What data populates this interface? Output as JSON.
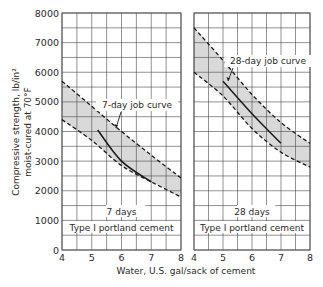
{
  "chart_data": [
    {
      "type": "line",
      "panel": "left",
      "title": "7 days",
      "subtitle": "Type I portland cement",
      "xlabel": "Water, U.S. gal/sack of cement",
      "ylabel": "Compressive strength, lb/in² moist-cured at 70°F",
      "xlim": [
        4,
        8
      ],
      "ylim": [
        0,
        8000
      ],
      "xticks": [
        4,
        5,
        6,
        7,
        8
      ],
      "yticks": [
        0,
        1000,
        2000,
        3000,
        4000,
        5000,
        6000,
        7000,
        8000
      ],
      "grid": true,
      "annotation": "7-day job curve",
      "series": [
        {
          "name": "Upper limit (dashed)",
          "style": "dashed",
          "x": [
            4,
            5,
            6,
            7,
            8
          ],
          "y": [
            5700,
            4850,
            4000,
            3200,
            2430
          ]
        },
        {
          "name": "Lower limit (dashed)",
          "style": "dashed",
          "x": [
            4,
            5,
            6,
            7,
            8
          ],
          "y": [
            4400,
            3700,
            2850,
            2300,
            1790
          ]
        },
        {
          "name": "7-day job curve",
          "style": "solid",
          "x": [
            5.2,
            6,
            7
          ],
          "y": [
            4050,
            3000,
            2300
          ]
        }
      ]
    },
    {
      "type": "line",
      "panel": "right",
      "title": "28 days",
      "subtitle": "Type I portland cement",
      "xlabel": "Water, U.S. gal/sack of cement",
      "xlim": [
        4,
        8
      ],
      "ylim": [
        0,
        8000
      ],
      "xticks": [
        4,
        5,
        6,
        7,
        8
      ],
      "grid": true,
      "annotation": "28-day job curve",
      "series": [
        {
          "name": "Upper limit (dashed)",
          "style": "dashed",
          "x": [
            4,
            5,
            6,
            7,
            8
          ],
          "y": [
            7500,
            6400,
            5250,
            4300,
            3600
          ]
        },
        {
          "name": "Lower limit (dashed)",
          "style": "dashed",
          "x": [
            4,
            5,
            6,
            7,
            8
          ],
          "y": [
            6000,
            5200,
            4100,
            3300,
            2800
          ]
        },
        {
          "name": "28-day job curve",
          "style": "solid",
          "x": [
            5,
            6,
            7
          ],
          "y": [
            5700,
            4600,
            3600
          ]
        }
      ]
    }
  ],
  "labels": {
    "ylabel_line1": "Compressive strength, lb/in²",
    "ylabel_line2": "moist-cured at 70°F",
    "xlabel": "Water, U.S. gal/sack of cement",
    "left_period": "7 days",
    "right_period": "28 days",
    "cement_type": "Type I portland cement",
    "left_annotation": "7-day job curve",
    "right_annotation": "28-day job curve"
  },
  "colors": {
    "grid": "#4a4a4a",
    "band_fill": "#d9d9d9",
    "curve": "#1a1a1a",
    "text": "#2a2a2a"
  }
}
